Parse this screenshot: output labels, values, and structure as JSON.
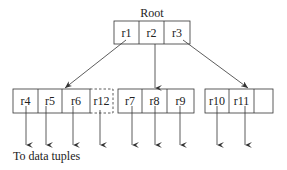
{
  "root": {
    "title": "Root",
    "cells": [
      "r1",
      "r2",
      "r3"
    ]
  },
  "leaves": [
    {
      "cells": [
        "r4",
        "r5",
        "r6"
      ],
      "dashed_cell": "r12"
    },
    {
      "cells": [
        "r7",
        "r8",
        "r9"
      ]
    },
    {
      "cells": [
        "r10",
        "r11",
        ""
      ]
    }
  ],
  "footer_label": "To data tuples",
  "colors": {
    "line": "#333333",
    "text": "#222222",
    "background": "#ffffff"
  }
}
